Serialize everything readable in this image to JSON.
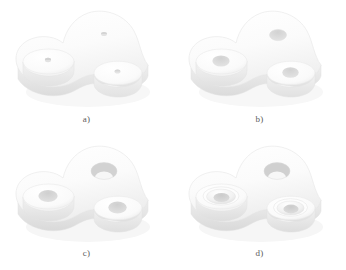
{
  "figure": {
    "caption": "",
    "background_color": "#ffffff",
    "panel_count": 4
  },
  "palette": {
    "background": "#ffffff",
    "top_face": "#fbfbfb",
    "top_face_shade": "#f3f3f3",
    "side_wall": "#e9e9e9",
    "side_wall_dark": "#dedede",
    "boss_top": "#fdfdfd",
    "boss_side": "#ededed",
    "hole_fill": "#e0e0e0",
    "hole_shadow": "#cfcfcf",
    "outline": "#e4e4e4",
    "cast_shadow": "#f2f2f2",
    "label_text": "#5b5b5b"
  },
  "panels": [
    {
      "id": "a",
      "label": "a)",
      "stage": "pilot-holes",
      "description": "Tri-lobe plate with two raised cylindrical bosses; three very small pilot holes drilled.",
      "hole_sizes": {
        "plate": "tiny",
        "left_boss": "tiny",
        "right_boss": "tiny"
      }
    },
    {
      "id": "b",
      "label": "b)",
      "stage": "drilled",
      "description": "Same body with the three holes enlarged to medium through-holes.",
      "hole_sizes": {
        "plate": "medium",
        "left_boss": "medium",
        "right_boss": "medium"
      }
    },
    {
      "id": "c",
      "label": "c)",
      "stage": "bored",
      "description": "Plate hole bored out large enough to reveal the inner bore wall; boss holes enlarged.",
      "hole_sizes": {
        "plate": "large",
        "left_boss": "medium-large",
        "right_boss": "medium-large"
      }
    },
    {
      "id": "d",
      "label": "d)",
      "stage": "counterbored",
      "description": "Boss holes counterbored with conical chamfer recesses; plate hole remains large.",
      "hole_sizes": {
        "plate": "large",
        "left_boss": "counterbored",
        "right_boss": "counterbored"
      }
    }
  ]
}
